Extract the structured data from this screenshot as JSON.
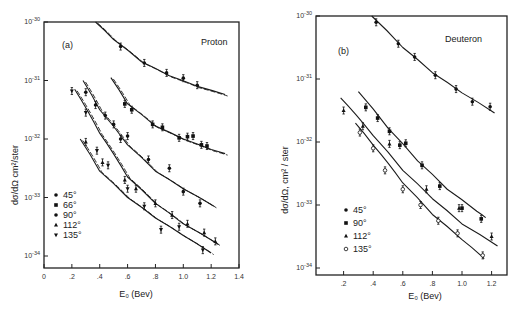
{
  "chart_data": [
    {
      "type": "scatter",
      "panel": "(a)",
      "title": "Proton",
      "xlabel": "E₀ (Bev)",
      "ylabel": "dσ/dΩ cm²/ster",
      "xlim": [
        0,
        1.4
      ],
      "ylim": [
        1e-34,
        1e-30
      ],
      "yscale": "log",
      "x_ticks": [
        "0",
        ".2",
        ".4",
        ".6",
        ".8",
        "1.0",
        "1.2",
        "1.4"
      ],
      "y_ticks": [
        "10^-30",
        "10^-31",
        "10^-32",
        "10^-33",
        "10^-34"
      ],
      "legend": [
        "45°",
        "66°",
        "90°",
        "112°",
        "135°"
      ],
      "series": [
        {
          "name": "45°",
          "marker": "dot",
          "x": [
            0.55,
            0.72,
            0.88,
            1.0,
            1.1
          ],
          "log10_y": [
            -30.42,
            -30.7,
            -30.87,
            -30.96,
            -31.08
          ],
          "curve_x": [
            0.37,
            0.5,
            0.7,
            0.9,
            1.1,
            1.3
          ],
          "curve_log10_y": [
            -30.0,
            -30.3,
            -30.68,
            -30.92,
            -31.1,
            -31.24
          ]
        },
        {
          "name": "66°",
          "marker": "square",
          "x": [
            0.58,
            0.63,
            0.78,
            0.85,
            0.97,
            1.03,
            1.07,
            1.13,
            1.17
          ],
          "log10_y": [
            -31.4,
            -31.5,
            -31.75,
            -31.8,
            -31.98,
            -31.96,
            -31.95,
            -32.1,
            -32.12
          ],
          "curve_x": [
            0.48,
            0.6,
            0.8,
            1.0,
            1.2,
            1.3
          ],
          "curve_log10_y": [
            -30.95,
            -31.4,
            -31.78,
            -32.0,
            -32.18,
            -32.25
          ]
        },
        {
          "name": "90°",
          "marker": "dot",
          "x": [
            0.3,
            0.37,
            0.44,
            0.5,
            0.55,
            0.6,
            0.75,
            0.9,
            1.0,
            1.12
          ],
          "log10_y": [
            -31.2,
            -31.42,
            -31.6,
            -31.75,
            -32.0,
            -31.95,
            -32.35,
            -32.5,
            -32.9,
            -33.1
          ],
          "curve_x": [
            0.28,
            0.4,
            0.6,
            0.8,
            1.0,
            1.22
          ],
          "curve_log10_y": [
            -31.0,
            -31.5,
            -32.1,
            -32.55,
            -32.85,
            -33.15
          ]
        },
        {
          "name": "112°",
          "marker": "triangle",
          "x": [
            0.3,
            0.42,
            0.58,
            0.66,
            0.8,
            0.92,
            1.03,
            1.15,
            1.23
          ],
          "log10_y": [
            -32.05,
            -32.4,
            -32.7,
            -32.85,
            -33.1,
            -33.3,
            -33.45,
            -33.6,
            -33.75
          ],
          "curve_x": [
            0.22,
            0.4,
            0.6,
            0.8,
            1.0,
            1.25
          ],
          "curve_log10_y": [
            -31.15,
            -31.9,
            -32.65,
            -33.1,
            -33.45,
            -33.8
          ]
        },
        {
          "name": "135°",
          "marker": "inverted-triangle",
          "x": [
            0.2,
            0.3,
            0.38,
            0.46,
            0.6,
            0.72,
            0.84,
            0.97,
            1.14
          ],
          "log10_y": [
            -31.18,
            -31.55,
            -32.2,
            -32.45,
            -32.85,
            -33.15,
            -33.55,
            -33.5,
            -33.9
          ],
          "curve_x": [
            0.26,
            0.4,
            0.6,
            0.8,
            1.0,
            1.2
          ],
          "curve_log10_y": [
            -32.0,
            -32.55,
            -33.0,
            -33.35,
            -33.65,
            -33.95
          ]
        }
      ]
    },
    {
      "type": "scatter",
      "panel": "(b)",
      "title": "Deuteron",
      "xlabel": "E₀ (Bev)",
      "ylabel": "dσ/dΩ, cm² / ster",
      "xlim": [
        0,
        1.3
      ],
      "ylim": [
        1e-34,
        1e-30
      ],
      "yscale": "log",
      "x_ticks": [
        ".2",
        ".4",
        ".6",
        ".8",
        "1.0",
        "1.2"
      ],
      "y_ticks": [
        "10^-30",
        "10^-31",
        "10^-32",
        "10^-33",
        "10^-34"
      ],
      "legend": [
        "45°",
        "90°",
        "112°",
        "135°"
      ],
      "series": [
        {
          "name": "45°",
          "marker": "dot",
          "x": [
            0.42,
            0.57,
            0.68,
            0.82,
            0.96,
            1.07,
            1.19
          ],
          "log10_y": [
            -30.1,
            -30.44,
            -30.65,
            -30.94,
            -31.16,
            -31.36,
            -31.44
          ],
          "curve_x": [
            0.39,
            0.6,
            0.8,
            1.0,
            1.22
          ],
          "curve_log10_y": [
            -30.0,
            -30.5,
            -30.9,
            -31.22,
            -31.54
          ]
        },
        {
          "name": "90°",
          "marker": "square",
          "x": [
            0.35,
            0.43,
            0.51,
            0.58,
            0.62,
            0.73,
            0.85,
            1.0,
            1.13
          ],
          "log10_y": [
            -31.45,
            -31.62,
            -31.83,
            -32.05,
            -32.02,
            -32.37,
            -32.7,
            -33.05,
            -33.22
          ],
          "curve_x": [
            0.3,
            0.5,
            0.7,
            0.9,
            1.1,
            1.16
          ],
          "curve_log10_y": [
            -31.2,
            -31.78,
            -32.3,
            -32.75,
            -33.1,
            -33.2
          ]
        },
        {
          "name": "112°",
          "marker": "triangle",
          "x": [
            0.2,
            0.33,
            0.51,
            0.76,
            0.98,
            1.2
          ],
          "log10_y": [
            -31.5,
            -31.75,
            -32.03,
            -32.75,
            -33.05,
            -33.5
          ],
          "curve_x": [
            0.18,
            0.4,
            0.6,
            0.8,
            1.0,
            1.24
          ],
          "curve_log10_y": [
            -31.3,
            -31.9,
            -32.45,
            -32.9,
            -33.3,
            -33.65
          ]
        },
        {
          "name": "135°",
          "marker": "open-circle",
          "x": [
            0.31,
            0.4,
            0.48,
            0.6,
            0.72,
            0.84,
            0.97,
            1.14
          ],
          "log10_y": [
            -31.85,
            -32.1,
            -32.45,
            -32.75,
            -33.0,
            -33.25,
            -33.45,
            -33.8
          ],
          "curve_x": [
            0.28,
            0.4,
            0.6,
            0.8,
            1.0,
            1.15
          ],
          "curve_log10_y": [
            -31.7,
            -32.05,
            -32.65,
            -33.15,
            -33.55,
            -33.85
          ]
        }
      ]
    }
  ],
  "labels": {
    "panel_a": "(a)",
    "panel_b": "(b)",
    "proton": "Proton",
    "deuteron": "Deuteron",
    "xlabel_a": "E₀ ( Bev )",
    "xlabel_b": "E₀ (Bev)",
    "ylabel_a": "dσ/dΩ cm²/ster",
    "ylabel_b": "dσ/dΩ, cm² / ster"
  }
}
